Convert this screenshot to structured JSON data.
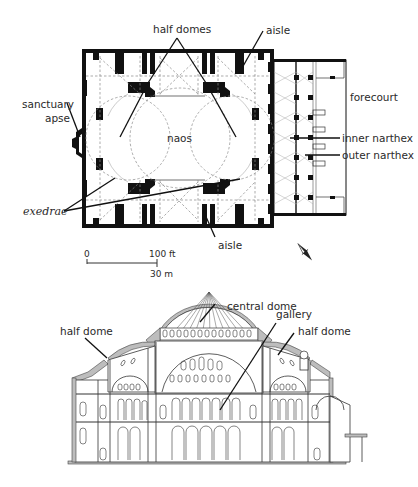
{
  "plan": {
    "labels": {
      "half_domes": "half domes",
      "aisle_top": "aisle",
      "sanctuary_apse_line1": "sanctuary",
      "sanctuary_apse_line2": "apse",
      "naos": "naos",
      "forecourt": "forecourt",
      "inner_narthex": "inner narthex",
      "outer_narthex": "outer narthex",
      "exedrae": "exedrae",
      "aisle_bottom": "aisle"
    },
    "scale_bar": {
      "zero": "0",
      "feet": "100 ft",
      "meters": "30 m"
    },
    "north_arrow": "north-arrow-icon"
  },
  "section": {
    "labels": {
      "central_dome": "central dome",
      "gallery": "gallery",
      "half_dome_left": "half dome",
      "half_dome_right": "half dome"
    }
  },
  "colors": {
    "walls": "#111111",
    "cut_section": "#bdbdbd",
    "text": "#2a2a2a",
    "background": "#ffffff"
  }
}
